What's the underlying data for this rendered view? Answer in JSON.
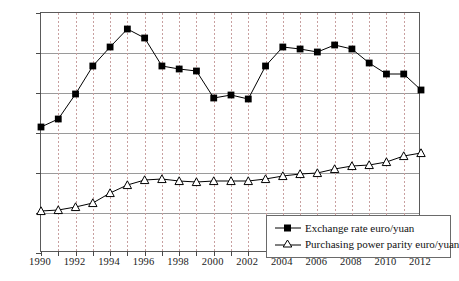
{
  "chart_data": {
    "type": "line",
    "title": "",
    "xlabel": "",
    "ylabel": "",
    "xlim": [
      1990,
      2012
    ],
    "ylim": [
      0,
      12
    ],
    "ytick_values": [
      0,
      2,
      4,
      6,
      8,
      10,
      12
    ],
    "ytick_labels": [
      "¥0",
      "¥2",
      "¥4",
      "¥6",
      "¥8",
      "¥10",
      "¥12"
    ],
    "xtick_values": [
      1990,
      1991,
      1992,
      1993,
      1994,
      1995,
      1996,
      1997,
      1998,
      1999,
      2000,
      2001,
      2002,
      2003,
      2004,
      2005,
      2006,
      2007,
      2008,
      2009,
      2010,
      2011,
      2012
    ],
    "xtick_labels_shown": [
      "1990",
      "1992",
      "1994",
      "1996",
      "1998",
      "2000",
      "2002",
      "2004",
      "2006",
      "2008",
      "2010",
      "2012"
    ],
    "grid": {
      "horizontal": true,
      "vertical": true,
      "vertical_style": "dotted"
    },
    "legend_position": "bottom-right",
    "x": [
      1990,
      1991,
      1992,
      1993,
      1994,
      1995,
      1996,
      1997,
      1998,
      1999,
      2000,
      2001,
      2002,
      2003,
      2004,
      2005,
      2006,
      2007,
      2008,
      2009,
      2010,
      2011,
      2012
    ],
    "series": [
      {
        "name": "Exchange rate euro/yuan",
        "marker": "filled-square",
        "color": "#000000",
        "values": [
          6.3,
          6.7,
          7.95,
          9.35,
          10.3,
          11.2,
          10.75,
          9.35,
          9.2,
          9.1,
          7.75,
          7.9,
          7.7,
          9.35,
          10.3,
          10.2,
          10.05,
          10.4,
          10.2,
          9.5,
          8.95,
          8.95,
          8.15
        ]
      },
      {
        "name": "Purchasing power parity euro/yuan",
        "marker": "open-triangle",
        "color": "#000000",
        "values": [
          2.1,
          2.15,
          2.3,
          2.5,
          3.0,
          3.4,
          3.65,
          3.7,
          3.6,
          3.55,
          3.6,
          3.6,
          3.6,
          3.7,
          3.85,
          3.95,
          4.0,
          4.2,
          4.35,
          4.4,
          4.55,
          4.85,
          5.0
        ]
      }
    ]
  },
  "legend": {
    "items": [
      {
        "label": "Exchange rate euro/yuan",
        "marker": "filled-square"
      },
      {
        "label": "Purchasing power parity euro/yuan",
        "marker": "open-triangle"
      }
    ]
  }
}
